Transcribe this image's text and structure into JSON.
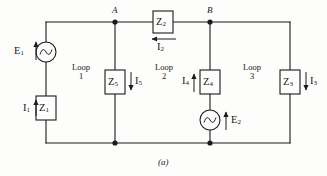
{
  "figure": {
    "caption": "(a)",
    "type": "ac-mesh-circuit-diagram"
  },
  "nodes": [
    {
      "id": "A",
      "label": "A",
      "x": 115,
      "y": 22
    },
    {
      "id": "B",
      "label": "B",
      "x": 210,
      "y": 22
    }
  ],
  "sources": [
    {
      "id": "E1",
      "label": "E",
      "sub": "1",
      "kind": "ac-source",
      "x": 46,
      "y": 52,
      "arrow": "up"
    },
    {
      "id": "E2",
      "label": "E",
      "sub": "2",
      "kind": "ac-source",
      "x": 210,
      "y": 120,
      "arrow": "up"
    }
  ],
  "impedances": [
    {
      "id": "Z1",
      "label": "Z",
      "sub": "1",
      "x": 46,
      "y": 108,
      "orientation": "vertical"
    },
    {
      "id": "Z2",
      "label": "Z",
      "sub": "2",
      "x": 163,
      "y": 22,
      "orientation": "horizontal"
    },
    {
      "id": "Z5",
      "label": "Z",
      "sub": "5",
      "x": 115,
      "y": 82,
      "orientation": "vertical"
    },
    {
      "id": "Z4",
      "label": "Z",
      "sub": "4",
      "x": 210,
      "y": 82,
      "orientation": "vertical"
    },
    {
      "id": "Z3",
      "label": "Z",
      "sub": "3",
      "x": 290,
      "y": 82,
      "orientation": "vertical"
    }
  ],
  "currents": [
    {
      "id": "I1",
      "label": "I",
      "sub": "1",
      "direction": "up",
      "x": 26,
      "y": 108
    },
    {
      "id": "I2",
      "label": "I",
      "sub": "2",
      "direction": "left",
      "x": 163,
      "y": 40
    },
    {
      "id": "I5",
      "label": "I",
      "sub": "5",
      "direction": "down",
      "x": 135,
      "y": 82
    },
    {
      "id": "I4",
      "label": "I",
      "sub": "4",
      "direction": "up",
      "x": 190,
      "y": 82
    },
    {
      "id": "I3",
      "label": "I",
      "sub": "3",
      "direction": "down",
      "x": 310,
      "y": 82
    }
  ],
  "loops": [
    {
      "id": "loop1",
      "line1": "Loop",
      "line2": "1",
      "x": 80,
      "y": 76
    },
    {
      "id": "loop2",
      "line1": "Loop",
      "line2": "2",
      "x": 163,
      "y": 76
    },
    {
      "id": "loop3",
      "line1": "Loop",
      "line2": "3",
      "x": 251,
      "y": 76
    }
  ],
  "colors": {
    "wire": "#1b1b1e",
    "background": "#fdfdfb",
    "text": "#17171a"
  }
}
